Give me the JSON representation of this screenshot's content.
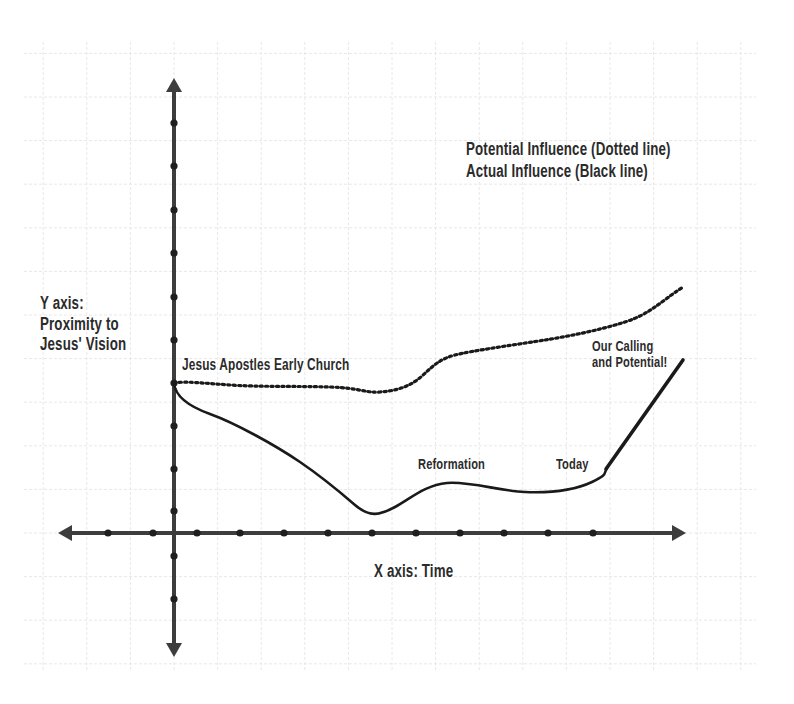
{
  "legend": {
    "potential": "Potential Influence (Dotted line)",
    "actual": "Actual Influence (Black line)"
  },
  "axes": {
    "y_label_line1": "Y axis:",
    "y_label_line2": "Proximity to",
    "y_label_line3": "Jesus' Vision",
    "x_label": "X axis: Time"
  },
  "annotations": {
    "start": "Jesus  Apostles Early Church",
    "reformation": "Reformation",
    "today": "Today",
    "calling_line1": "Our Calling",
    "calling_line2": "and Potential!"
  },
  "colors": {
    "axis": "#3d3d3d",
    "curve": "#1a1a1a",
    "grid": "#e6e6e6",
    "text": "#2b2b2b"
  },
  "chart_data": {
    "type": "line",
    "title": "",
    "xlabel": "X axis: Time",
    "ylabel": "Y axis: Proximity to Jesus' Vision",
    "grid": true,
    "legend": [
      "Potential Influence (Dotted line)",
      "Actual Influence (Black line)"
    ],
    "legend_position": "top-right",
    "x_ticks_count": 13,
    "y_ticks_count": 13,
    "series": [
      {
        "name": "Potential Influence (Dotted line)",
        "style": "dotted",
        "points_px": [
          [
            174,
            383
          ],
          [
            195,
            382
          ],
          [
            230,
            385
          ],
          [
            280,
            386
          ],
          [
            330,
            387
          ],
          [
            375,
            392
          ],
          [
            405,
            388
          ],
          [
            425,
            372
          ],
          [
            448,
            357
          ],
          [
            490,
            348
          ],
          [
            540,
            341
          ],
          [
            590,
            331
          ],
          [
            625,
            322
          ],
          [
            650,
            308
          ],
          [
            683,
            287
          ]
        ],
        "relative_values": [
          3.5,
          3.5,
          3.45,
          3.4,
          3.4,
          3.3,
          3.4,
          3.7,
          4.0,
          4.2,
          4.35,
          4.6,
          4.8,
          5.1,
          5.6
        ]
      },
      {
        "name": "Actual Influence (Black line)",
        "style": "solid",
        "points_px": [
          [
            174,
            383
          ],
          [
            180,
            398
          ],
          [
            210,
            414
          ],
          [
            250,
            433
          ],
          [
            295,
            458
          ],
          [
            330,
            483
          ],
          [
            352,
            503
          ],
          [
            375,
            511
          ],
          [
            395,
            507
          ],
          [
            415,
            493
          ],
          [
            447,
            483
          ],
          [
            485,
            487
          ],
          [
            525,
            492
          ],
          [
            565,
            490
          ],
          [
            592,
            482
          ],
          [
            605,
            471
          ],
          [
            683,
            360
          ]
        ],
        "relative_values": [
          3.5,
          3.15,
          2.8,
          2.35,
          1.8,
          1.2,
          0.7,
          0.5,
          0.6,
          0.95,
          1.15,
          1.1,
          0.95,
          1.0,
          1.2,
          1.45,
          4.0
        ]
      }
    ],
    "annotations": [
      {
        "text": "Jesus Apostles Early Church",
        "x": 182,
        "y": 358
      },
      {
        "text": "Reformation",
        "x": 418,
        "y": 456
      },
      {
        "text": "Today",
        "x": 556,
        "y": 456
      },
      {
        "text": "Our Calling and Potential!",
        "x": 592,
        "y": 340
      }
    ]
  }
}
